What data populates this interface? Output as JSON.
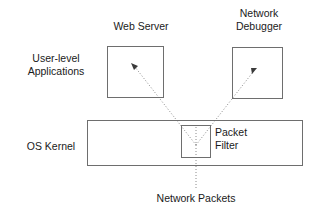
{
  "diagram": {
    "background_color": "#ffffff",
    "stroke_color": "#6e6e6e",
    "text_color": "#1a1a1a",
    "labels": {
      "user_level_applications": "User-level\nApplications",
      "web_server": "Web Server",
      "network_debugger": "Network\nDebugger",
      "os_kernel": "OS Kernel",
      "packet_filter": "Packet\nFilter",
      "network_packets": "Network Packets"
    },
    "boxes": [
      {
        "name": "web-server-box",
        "label": "Web Server",
        "x": 107,
        "y": 46,
        "width": 57,
        "height": 52
      },
      {
        "name": "network-debugger-box",
        "label": "Network Debugger",
        "x": 232,
        "y": 47,
        "width": 51,
        "height": 52
      },
      {
        "name": "os-kernel-box",
        "label": "OS Kernel",
        "x": 87,
        "y": 120,
        "width": 216,
        "height": 46
      },
      {
        "name": "packet-filter-box",
        "label": "Packet Filter",
        "x": 181,
        "y": 125,
        "width": 30,
        "height": 33
      }
    ],
    "connectors": [
      {
        "name": "packets-to-web-server",
        "style": "dotted",
        "arrowhead": "at-web-server",
        "from": [
          196,
          145
        ],
        "to": [
          133,
          65
        ]
      },
      {
        "name": "packets-to-network-debugger",
        "style": "dotted",
        "arrowhead": "at-network-debugger",
        "from": [
          196,
          145
        ],
        "to": [
          255,
          70
        ]
      },
      {
        "name": "network-packets-inflow",
        "style": "dotted",
        "arrowhead": "none",
        "from": [
          196,
          188
        ],
        "to": [
          196,
          125
        ]
      }
    ]
  }
}
